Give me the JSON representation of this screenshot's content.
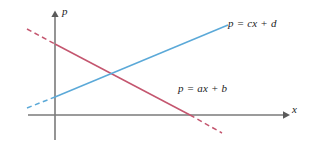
{
  "figure": {
    "title": "",
    "background_color": "#ffffff",
    "width": 312,
    "height": 152
  },
  "axes": {
    "y_axis": {
      "label": "p",
      "color": "#7a7a7a",
      "x": 55,
      "y_top": 12,
      "y_bottom": 140,
      "arrow": "up"
    },
    "x_axis": {
      "label": "x",
      "color": "#7a7a7a",
      "y": 115,
      "x_left": 28,
      "x_right": 287,
      "arrow": "right"
    },
    "origin": {
      "x": 55,
      "y": 115
    },
    "ticks": [],
    "grid": false
  },
  "chart_data": {
    "type": "line",
    "title": "",
    "xlabel": "x",
    "ylabel": "p",
    "grid": false,
    "legend": "inline-annotations",
    "xlim": [
      -1,
      10
    ],
    "ylim": [
      -1,
      5
    ],
    "series": [
      {
        "name": "p = ax + b",
        "label": "p = ax + b",
        "color": "#c4566f",
        "slope_sign": "negative",
        "description": "downward sloping demand line",
        "solid_segment": {
          "x1": 55,
          "y1": 44,
          "x2": 190,
          "y2": 115
        },
        "dashed_segments": [
          {
            "x1": 27,
            "y1": 29,
            "x2": 55,
            "y2": 44
          },
          {
            "x1": 190,
            "y1": 115,
            "x2": 222,
            "y2": 133
          }
        ],
        "y_intercept_px": 44,
        "x_intercept_px": 190
      },
      {
        "name": "p = cx + d",
        "label": "p = cx + d",
        "color": "#5ba9d8",
        "slope_sign": "positive",
        "description": "upward sloping supply line",
        "solid_segment": {
          "x1": 55,
          "y1": 97,
          "x2": 228,
          "y2": 25
        },
        "dashed_segments": [
          {
            "x1": 27,
            "y1": 108,
            "x2": 55,
            "y2": 97
          }
        ],
        "y_intercept_px": 97
      }
    ],
    "intersection": {
      "x": 113,
      "y": 70,
      "note": "equilibrium point (unmarked)"
    },
    "annotations": [
      {
        "text": "p = cx + d",
        "x": 228,
        "y": 17,
        "series": "p = cx + d"
      },
      {
        "text": "p = ax + b",
        "x": 178,
        "y": 82,
        "series": "p = ax + b"
      }
    ]
  }
}
